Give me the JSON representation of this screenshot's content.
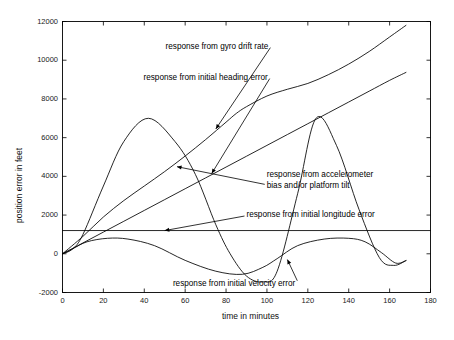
{
  "chart_data": {
    "type": "line",
    "title": "",
    "xlabel": "time in minutes",
    "ylabel": "position error in feet",
    "xlim": [
      0,
      180
    ],
    "ylim": [
      -2000,
      12000
    ],
    "xticks": [
      0,
      20,
      40,
      60,
      80,
      100,
      120,
      140,
      160,
      180
    ],
    "xtick_labels": [
      "0",
      "20",
      "40",
      "60",
      "80",
      "100",
      "120",
      "140",
      "160",
      "180"
    ],
    "yticks": [
      -2000,
      0,
      2000,
      4000,
      6000,
      8000,
      10000,
      12000
    ],
    "ytick_labels": [
      "-2000",
      "0",
      "2000",
      "4000",
      "6000",
      "8000",
      "10000",
      "12000"
    ],
    "grid": false,
    "legend": "none (inline annotations with leader arrows)",
    "line_color": "#000000",
    "series": [
      {
        "name": "response from gyro drift rate",
        "x": [
          0,
          10,
          20,
          30,
          40,
          50,
          60,
          70,
          80,
          85,
          90,
          100,
          110,
          120,
          130,
          140,
          150,
          160,
          168
        ],
        "values": [
          0,
          900,
          1900,
          2750,
          3500,
          4250,
          5050,
          5900,
          6800,
          7250,
          7600,
          8150,
          8500,
          8800,
          9250,
          9800,
          10450,
          11200,
          11800
        ]
      },
      {
        "name": "response from initial heading error",
        "x": [
          0,
          10,
          20,
          30,
          40,
          50,
          60,
          70,
          80,
          90,
          100,
          110,
          120,
          130,
          140,
          150,
          160,
          168
        ],
        "values": [
          0,
          560,
          1120,
          1680,
          2240,
          2800,
          3360,
          3920,
          4480,
          5040,
          5600,
          6160,
          6720,
          7280,
          7840,
          8400,
          8960,
          9370
        ]
      },
      {
        "name": "response from accelerometer bias and/or platform tilt",
        "x": [
          0,
          5,
          10,
          20,
          30,
          42,
          55,
          65,
          75,
          82,
          90,
          98,
          105,
          115,
          124,
          134,
          145,
          155,
          162,
          168
        ],
        "values": [
          0,
          250,
          1000,
          3500,
          5800,
          7000,
          5800,
          4100,
          1500,
          0,
          -1150,
          -1450,
          -900,
          3100,
          7000,
          5600,
          2300,
          -200,
          -600,
          -350
        ]
      },
      {
        "name": "response from initial longitude error",
        "x": [
          0,
          180
        ],
        "values": [
          1200,
          1200
        ]
      },
      {
        "name": "response from initial velocity error",
        "x": [
          0,
          5,
          12,
          22,
          32,
          45,
          60,
          75,
          88,
          98,
          105,
          115,
          128,
          140,
          148,
          156,
          163,
          168
        ],
        "values": [
          0,
          260,
          620,
          800,
          760,
          420,
          -340,
          -900,
          -1060,
          -700,
          -250,
          420,
          760,
          800,
          620,
          60,
          -480,
          -350
        ]
      }
    ],
    "annotations": [
      {
        "id": "annot-gyro",
        "text": "response from gyro drift rate",
        "text_xy": [
          0.28,
          10650
        ],
        "arrow_to": [
          75,
          6450
        ]
      },
      {
        "id": "annot-heading",
        "text": "response from initial heading error",
        "text_xy": [
          0.22,
          9050
        ],
        "arrow_to": [
          73,
          4150
        ]
      },
      {
        "id": "annot-accel",
        "text_line1": "response from accelerometer",
        "text_line2": "bias and/or platform tilt",
        "text_xy": [
          0.555,
          4000
        ],
        "arrow_to": [
          56,
          4500
        ]
      },
      {
        "id": "annot-longitude",
        "text": "response from initial longitude error",
        "text_xy": [
          0.5,
          1950
        ],
        "arrow_to": [
          50,
          1200
        ]
      },
      {
        "id": "annot-velocity",
        "text": "response from initial velocity error",
        "text_xy": [
          0.3,
          -1600
        ],
        "arrow_to": [
          110,
          -300
        ]
      }
    ]
  },
  "axis": {
    "x_title": "time in minutes",
    "y_title": "position error in feet"
  },
  "annotation_text": {
    "gyro": "response from gyro drift rate",
    "heading": "response from initial heading error",
    "accel_line1": "response from accelerometer",
    "accel_line2": "bias and/or platform tilt",
    "longitude": "response from initial longitude error",
    "velocity": "response from initial velocity error"
  }
}
